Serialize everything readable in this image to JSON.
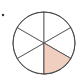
{
  "diagram": {
    "type": "fraction-circle",
    "total_parts": 6,
    "shaded_parts": 1,
    "fraction": "1/6",
    "shaded_sector_index": 2,
    "colors": {
      "outline": "#4a4a4a",
      "shaded_fill": "#f1cfc0",
      "unshaded_fill": "#ffffff",
      "bullet": "#333333"
    },
    "center": [
      44,
      43
    ],
    "radius": 31
  }
}
